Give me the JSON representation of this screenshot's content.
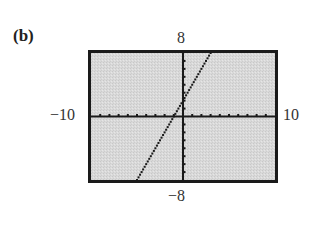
{
  "figure": {
    "part_label": "(b)"
  },
  "window": {
    "xmin_label": "−10",
    "xmax_label": "10",
    "ymin_label": "−8",
    "ymax_label": "8"
  },
  "colors": {
    "screen_bg": "#d6d6d6",
    "frame": "#1a1a1a",
    "axes": "#1a1a1a",
    "line": "#1a1a1a"
  },
  "chart_data": {
    "type": "line",
    "title": "(b)",
    "xlabel": "",
    "ylabel": "",
    "xlim": [
      -10,
      10
    ],
    "ylim": [
      -8,
      8
    ],
    "x_tick_step": 1,
    "y_tick_step": 1,
    "grid": false,
    "legend": null,
    "tick_labels": {
      "xmin": "-10",
      "xmax": "10",
      "ymin": "-8",
      "ymax": "8"
    },
    "series": [
      {
        "name": "y = 2x + 2",
        "style": "dotted calculator pixels",
        "x": [
          -5,
          3
        ],
        "y": [
          -8,
          8
        ]
      }
    ]
  }
}
